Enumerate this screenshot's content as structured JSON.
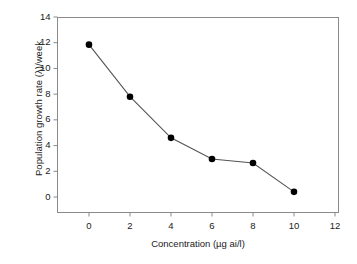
{
  "chart_data": {
    "type": "line",
    "title": "",
    "subtitle": "",
    "xlabel": "Concentration (µg ai/l)",
    "ylabel": "Population growth rate (λ)/week",
    "x": [
      0,
      2,
      4,
      6,
      8,
      10
    ],
    "values": [
      11.85,
      7.8,
      4.6,
      2.95,
      2.65,
      0.4
    ],
    "series": [
      {
        "name": "Population growth rate",
        "x": [
          0,
          2,
          4,
          6,
          8,
          10
        ],
        "values": [
          11.85,
          7.8,
          4.6,
          2.95,
          2.65,
          0.4
        ]
      }
    ],
    "xlim": [
      -1,
      12
    ],
    "ylim": [
      -1,
      14
    ],
    "xticks": [
      0,
      2,
      4,
      6,
      8,
      10,
      12
    ],
    "yticks": [
      0,
      2,
      4,
      6,
      8,
      10,
      12,
      14
    ],
    "xtick_labels": [
      "0",
      "2",
      "4",
      "6",
      "8",
      "10",
      "12"
    ],
    "ytick_labels": [
      "0",
      "2",
      "4",
      "6",
      "8",
      "10",
      "12",
      "14"
    ],
    "grid": false,
    "legend": null,
    "marker": "filled-circle",
    "marker_color": "#000000",
    "line_color": "#555555",
    "frame_color": "#8a8a8a",
    "background": "#ffffff"
  }
}
